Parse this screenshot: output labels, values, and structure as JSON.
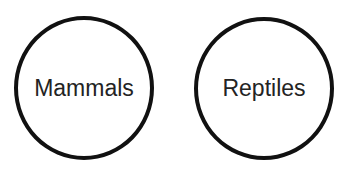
{
  "diagram": {
    "type": "separate-sets",
    "sets": [
      {
        "label": "Mammals"
      },
      {
        "label": "Reptiles"
      }
    ],
    "colors": {
      "outline": "#111111",
      "text": "#232323",
      "background": "#ffffff"
    }
  }
}
